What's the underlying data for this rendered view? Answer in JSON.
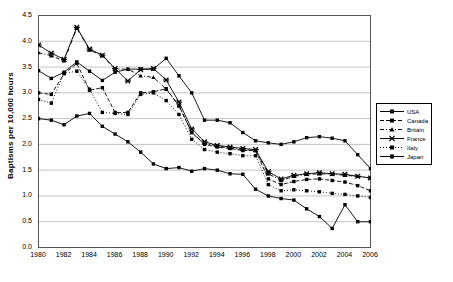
{
  "chart_data": {
    "type": "line",
    "title": "",
    "xlabel": "",
    "ylabel": "Baptisms per 10,000 hours",
    "xlim": [
      1980,
      2006
    ],
    "ylim": [
      0.0,
      4.5
    ],
    "grid": true,
    "legend_position": "right",
    "x": [
      1980,
      1981,
      1982,
      1983,
      1984,
      1985,
      1986,
      1987,
      1988,
      1989,
      1990,
      1991,
      1992,
      1993,
      1994,
      1995,
      1996,
      1997,
      1998,
      1999,
      2000,
      2001,
      2002,
      2003,
      2004,
      2005,
      2006
    ],
    "xticks": [
      "1980",
      "1982",
      "1984",
      "1986",
      "1988",
      "1990",
      "1992",
      "1994",
      "1996",
      "1998",
      "2000",
      "2002",
      "2004",
      "2006"
    ],
    "yticks": [
      "0.0",
      "0.5",
      "1.0",
      "1.5",
      "2.0",
      "2.5",
      "3.0",
      "3.5",
      "4.0",
      "4.5"
    ],
    "series": [
      {
        "name": "USA",
        "marker": "square",
        "dash": "solid",
        "color": "#000000",
        "values": [
          3.43,
          3.28,
          3.4,
          3.6,
          3.42,
          3.24,
          3.4,
          3.46,
          3.46,
          3.46,
          3.67,
          3.33,
          3.0,
          2.47,
          2.47,
          2.42,
          2.23,
          2.07,
          2.03,
          2.0,
          2.05,
          2.13,
          2.15,
          2.12,
          2.07,
          1.8,
          1.53
        ]
      },
      {
        "name": "Canada",
        "marker": "square",
        "dash": "dashed",
        "color": "#000000",
        "values": [
          3.0,
          2.97,
          3.37,
          3.57,
          3.05,
          3.1,
          2.62,
          2.62,
          3.0,
          3.02,
          3.08,
          2.75,
          2.23,
          2.0,
          1.95,
          1.92,
          1.88,
          1.88,
          1.33,
          1.22,
          1.28,
          1.32,
          1.33,
          1.3,
          1.27,
          1.2,
          1.1
        ]
      },
      {
        "name": "Britain",
        "marker": "triangle",
        "dash": "dashdot",
        "color": "#000000",
        "values": [
          3.78,
          3.72,
          3.62,
          4.25,
          3.83,
          3.72,
          3.46,
          3.46,
          3.33,
          3.3,
          3.07,
          2.75,
          2.23,
          2.02,
          1.97,
          1.93,
          1.9,
          1.88,
          1.43,
          1.3,
          1.38,
          1.42,
          1.43,
          1.42,
          1.4,
          1.38,
          1.35
        ]
      },
      {
        "name": "France",
        "marker": "cross",
        "dash": "solid",
        "color": "#000000",
        "values": [
          3.93,
          3.77,
          3.65,
          4.27,
          3.85,
          3.73,
          3.47,
          3.23,
          3.45,
          3.47,
          3.25,
          2.82,
          2.3,
          2.05,
          1.98,
          1.95,
          1.92,
          1.9,
          1.47,
          1.33,
          1.4,
          1.43,
          1.45,
          1.43,
          1.42,
          1.38,
          1.35
        ]
      },
      {
        "name": "Italy",
        "marker": "square",
        "dash": "dotted",
        "color": "#000000",
        "values": [
          2.87,
          2.8,
          3.38,
          3.42,
          3.07,
          2.62,
          2.6,
          2.58,
          2.97,
          3.0,
          2.85,
          2.58,
          2.1,
          1.9,
          1.85,
          1.82,
          1.78,
          1.78,
          1.22,
          1.1,
          1.12,
          1.1,
          1.08,
          1.05,
          1.03,
          1.0,
          0.97
        ]
      },
      {
        "name": "Japan",
        "marker": "square",
        "dash": "solid",
        "color": "#000000",
        "values": [
          2.5,
          2.47,
          2.38,
          2.55,
          2.6,
          2.35,
          2.2,
          2.05,
          1.85,
          1.62,
          1.53,
          1.55,
          1.48,
          1.53,
          1.5,
          1.43,
          1.42,
          1.13,
          1.0,
          0.95,
          0.92,
          0.75,
          0.6,
          0.37,
          0.83,
          0.5,
          0.5
        ]
      }
    ]
  }
}
